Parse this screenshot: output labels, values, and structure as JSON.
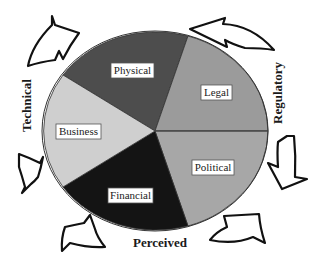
{
  "diagram": {
    "type": "segmented-ellipse-with-arrows",
    "center": {
      "x": 155,
      "y": 131
    },
    "segments": [
      {
        "id": "physical",
        "label": "Physical",
        "color": "#4d4d4d"
      },
      {
        "id": "legal",
        "label": "Legal",
        "color": "#9b9b9b"
      },
      {
        "id": "political",
        "label": "Political",
        "color": "#a7a7a7"
      },
      {
        "id": "financial",
        "label": "Financial",
        "color": "#141414"
      },
      {
        "id": "business",
        "label": "Business",
        "color": "#cfcfcf"
      }
    ],
    "outer_labels": {
      "technical": "Technical",
      "regulatory": "Regulatory",
      "perceived": "Perceived"
    },
    "arrows": [
      "top-left",
      "top-right",
      "right",
      "bottom-right",
      "bottom-left",
      "left"
    ],
    "arrow_direction": "counter-clockwise"
  }
}
